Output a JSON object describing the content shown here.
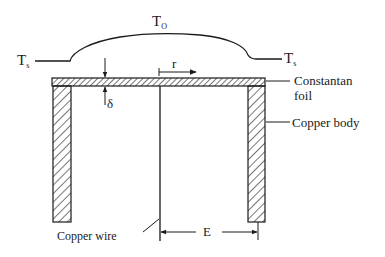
{
  "diagram": {
    "type": "cross-section schematic of a Gardon gauge heat flux sensor",
    "labels": {
      "t_center": {
        "main": "T",
        "sub": "O"
      },
      "t_side_left": {
        "main": "T",
        "sub": "s"
      },
      "t_side_right": {
        "main": "T",
        "sub": "s"
      },
      "radial_coordinate": "r",
      "foil_thickness": "δ",
      "foil": [
        "Constantan",
        "foil"
      ],
      "body": "Copper body",
      "wire": "Copper wire",
      "radius": "E"
    },
    "colors": {
      "line": "#1a1a1a",
      "background": "#ffffff"
    }
  }
}
